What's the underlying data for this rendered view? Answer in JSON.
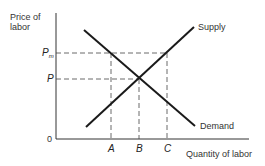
{
  "diagram": {
    "type": "supply-demand",
    "y_axis_label_line1": "Price of",
    "y_axis_label_line2": "labor",
    "x_axis_label": "Quantity of labor",
    "origin_label": "0",
    "price_labels": {
      "pm_main": "P",
      "pm_sub": "m",
      "p": "P"
    },
    "quantity_labels": {
      "a": "A",
      "b": "B",
      "c": "C"
    },
    "curves": {
      "supply": "Supply",
      "demand": "Demand"
    },
    "colors": {
      "line": "#1a1a1a",
      "text": "#333333"
    }
  }
}
